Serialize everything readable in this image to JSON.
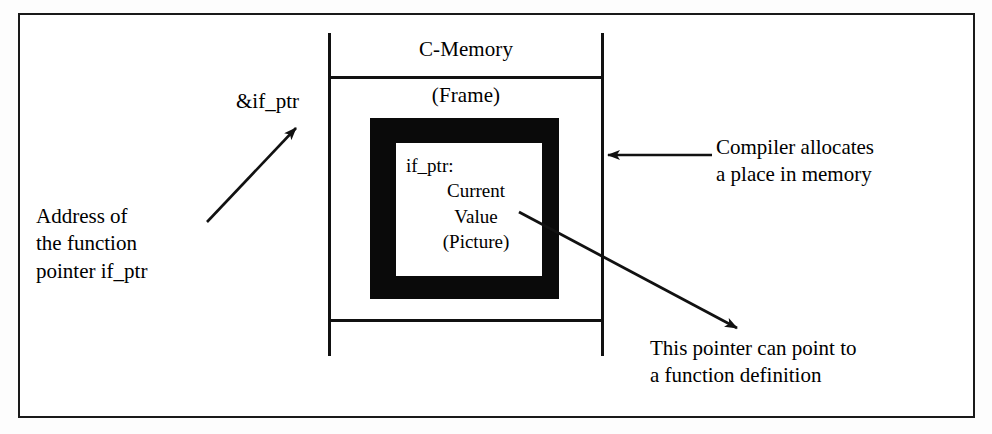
{
  "figure": {
    "background_color": "#ffffff",
    "ink_color": "#111111"
  },
  "memory_column": {
    "header_label": "C-Memory",
    "frame_label": "(Frame)",
    "cell": {
      "border_color": "#0a0a0a",
      "fill_color": "#ffffff",
      "lines": [
        "if_ptr:",
        "Current",
        "Value",
        "(Picture)"
      ]
    }
  },
  "annotations": [
    {
      "name": "address-of-label",
      "text": "&if_ptr"
    },
    {
      "name": "address-of-description",
      "text": "Address of\nthe function\npointer if_ptr"
    },
    {
      "name": "compiler-allocates-note",
      "text": "Compiler allocates\na place in memory"
    },
    {
      "name": "pointer-target-note",
      "text": "This pointer can point to\na function definition"
    }
  ],
  "arrows": [
    {
      "name": "arrow-to-address-label",
      "from": [
        207,
        222
      ],
      "to": [
        296,
        128
      ],
      "direction": "up-right"
    },
    {
      "name": "arrow-to-memory-column",
      "from": [
        712,
        155
      ],
      "to": [
        606,
        155
      ],
      "direction": "left"
    },
    {
      "name": "arrow-to-function-definition",
      "from": [
        519,
        212
      ],
      "to": [
        735,
        327
      ],
      "direction": "down-right"
    }
  ]
}
